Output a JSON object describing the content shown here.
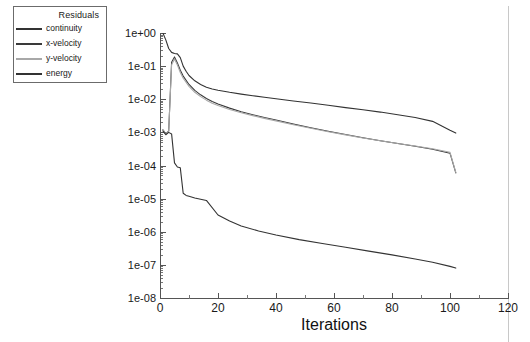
{
  "chart_data": {
    "type": "line",
    "title": "",
    "xlabel": "Iterations",
    "ylabel": "",
    "xlim": [
      0,
      120
    ],
    "ylim": [
      1e-08,
      1.0
    ],
    "yscale": "log",
    "grid": false,
    "legend": {
      "title": "Residuals",
      "position": "upper-left-outside",
      "entries": [
        {
          "name": "continuity",
          "color": "#333333"
        },
        {
          "name": "x-velocity",
          "color": "#3a3a3a"
        },
        {
          "name": "y-velocity",
          "color": "#a8a8a8"
        },
        {
          "name": "energy",
          "color": "#333333"
        }
      ]
    },
    "xticks": [
      0,
      20,
      40,
      60,
      80,
      100,
      120
    ],
    "xtick_labels": [
      "0",
      "20",
      "40",
      "60",
      "80",
      "100",
      "120"
    ],
    "yticks": [
      1.0,
      0.1,
      0.01,
      0.001,
      0.0001,
      1e-05,
      1e-06,
      1e-07,
      1e-08
    ],
    "ytick_labels": [
      "1e+00",
      "1e-01",
      "1e-02",
      "1e-03",
      "1e-04",
      "1e-05",
      "1e-06",
      "1e-07",
      "1e-08"
    ],
    "series": [
      {
        "name": "continuity",
        "color": "#333333",
        "x": [
          1,
          2,
          3,
          4,
          5,
          6,
          7,
          8,
          9,
          10,
          12,
          14,
          16,
          18,
          20,
          24,
          28,
          32,
          36,
          40,
          46,
          52,
          58,
          64,
          70,
          76,
          82,
          88,
          94,
          100,
          102
        ],
        "y": [
          1.0,
          0.62,
          0.34,
          0.26,
          0.24,
          0.235,
          0.18,
          0.1,
          0.07,
          0.052,
          0.036,
          0.028,
          0.023,
          0.0205,
          0.0188,
          0.0162,
          0.0143,
          0.0128,
          0.0115,
          0.0104,
          0.0089,
          0.0077,
          0.0066,
          0.0056,
          0.0048,
          0.0041,
          0.0034,
          0.0028,
          0.00215,
          0.00115,
          0.00095
        ]
      },
      {
        "name": "x-velocity",
        "color": "#3a3a3a",
        "x": [
          1,
          2,
          3,
          4,
          5,
          6,
          7,
          8,
          10,
          12,
          14,
          16,
          18,
          20,
          24,
          28,
          32,
          36,
          40,
          46,
          52,
          58,
          64,
          70,
          76,
          82,
          88,
          94,
          100,
          102
        ],
        "y": [
          0.0012,
          0.0009,
          0.0011,
          0.13,
          0.19,
          0.125,
          0.075,
          0.05,
          0.028,
          0.0185,
          0.0136,
          0.0105,
          0.0085,
          0.0072,
          0.0054,
          0.0042,
          0.0034,
          0.0028,
          0.00235,
          0.00178,
          0.00138,
          0.00108,
          0.00086,
          0.00069,
          0.00056,
          0.00046,
          0.00038,
          0.00031,
          0.000235,
          6e-05
        ]
      },
      {
        "name": "y-velocity",
        "color": "#a8a8a8",
        "x": [
          1,
          2,
          3,
          4,
          5,
          6,
          7,
          8,
          10,
          12,
          14,
          16,
          18,
          20,
          24,
          28,
          32,
          36,
          40,
          46,
          52,
          58,
          64,
          70,
          76,
          82,
          88,
          94,
          100,
          102
        ],
        "y": [
          0.0012,
          0.0009,
          0.0011,
          0.11,
          0.165,
          0.108,
          0.064,
          0.043,
          0.0245,
          0.0162,
          0.012,
          0.0094,
          0.0076,
          0.0065,
          0.0049,
          0.0039,
          0.0032,
          0.00265,
          0.00222,
          0.0017,
          0.00133,
          0.00105,
          0.00084,
          0.00068,
          0.00056,
          0.00046,
          0.00039,
          0.00032,
          0.00025,
          6.2e-05
        ]
      },
      {
        "name": "energy",
        "color": "#333333",
        "x": [
          1,
          2,
          3,
          4,
          5,
          6,
          7,
          8,
          9,
          10,
          12,
          14,
          16,
          20,
          24,
          28,
          34,
          40,
          48,
          56,
          64,
          72,
          80,
          88,
          94,
          100,
          102
        ],
        "y": [
          0.0011,
          0.00085,
          0.001,
          0.0009,
          0.00012,
          9e-05,
          8.5e-05,
          1.45e-05,
          1.25e-05,
          1.18e-05,
          1.05e-05,
          9.6e-06,
          8.8e-06,
          3.2e-06,
          2.1e-06,
          1.5e-06,
          1.05e-06,
          8e-07,
          5.8e-07,
          4.4e-07,
          3.4e-07,
          2.6e-07,
          2e-07,
          1.5e-07,
          1.2e-07,
          9e-08,
          8e-08
        ]
      }
    ]
  }
}
